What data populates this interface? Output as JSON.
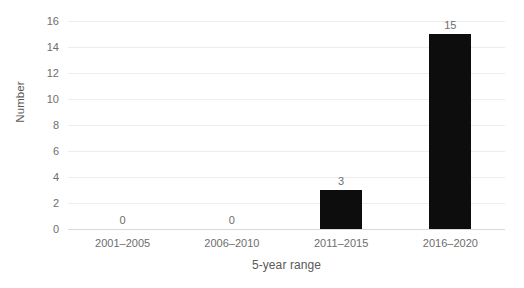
{
  "chart_data": {
    "type": "bar",
    "title": "",
    "subtitle": "",
    "xlabel": "5-year range",
    "ylabel": "Number",
    "categories": [
      "2001–2005",
      "2006–2010",
      "2011–2015",
      "2016–2020"
    ],
    "values": [
      0,
      0,
      3,
      15
    ],
    "value_labels": [
      "0",
      "0",
      "3",
      "15"
    ],
    "ylim": [
      0,
      16
    ],
    "ytick_labels": [
      "0",
      "2",
      "4",
      "6",
      "8",
      "10",
      "12",
      "14",
      "16"
    ],
    "ytick_values": [
      0,
      2,
      4,
      6,
      8,
      10,
      12,
      14,
      16
    ],
    "grid": "horizontal",
    "legend": "none",
    "bar_color": "#0d0d0d",
    "gridline_color": "#ededed",
    "axis_color": "#d9d9d9",
    "text_color": "#6e6e6e",
    "background_color": "#ffffff"
  }
}
